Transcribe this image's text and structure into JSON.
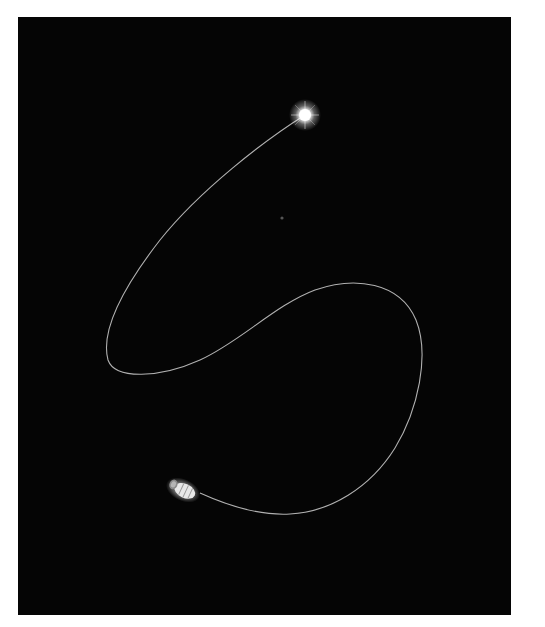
{
  "scene": {
    "description": "Spacecraft trajectory curve against black space, ending at a bright star",
    "background_color": "#050505",
    "frame_color": "#ffffff",
    "trajectory_color": "#d8d8d8",
    "star": {
      "icon": "bright-star-icon",
      "x": 305,
      "y": 115,
      "color": "#ffffff"
    },
    "faint_object": {
      "icon": "faint-dot-icon",
      "x": 282,
      "y": 218
    },
    "spacecraft": {
      "icon": "spacecraft-icon",
      "x": 183,
      "y": 490,
      "color": "#e6e6e6"
    },
    "trajectory_points": [
      [
        305,
        115
      ],
      [
        270,
        140
      ],
      [
        230,
        170
      ],
      [
        190,
        205
      ],
      [
        155,
        245
      ],
      [
        125,
        290
      ],
      [
        106,
        330
      ],
      [
        108,
        360
      ],
      [
        140,
        376
      ],
      [
        180,
        368
      ],
      [
        215,
        352
      ],
      [
        255,
        322
      ],
      [
        295,
        297
      ],
      [
        330,
        285
      ],
      [
        365,
        285
      ],
      [
        395,
        300
      ],
      [
        415,
        325
      ],
      [
        422,
        360
      ],
      [
        416,
        400
      ],
      [
        400,
        440
      ],
      [
        372,
        478
      ],
      [
        335,
        505
      ],
      [
        295,
        514
      ],
      [
        255,
        510
      ],
      [
        225,
        502
      ],
      [
        200,
        493
      ]
    ]
  }
}
